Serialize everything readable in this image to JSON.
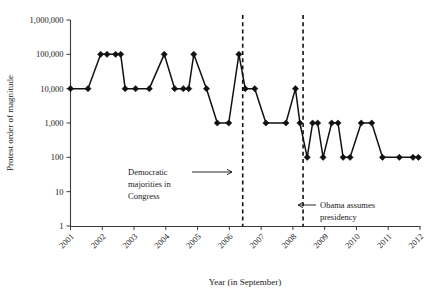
{
  "chart_data": {
    "type": "line",
    "title": "",
    "xlabel": "Year (in September)",
    "ylabel": "Protest order of magnitude",
    "yscale": "log",
    "ylim": [
      1,
      1000000
    ],
    "xlim": [
      2001,
      2012
    ],
    "grid": false,
    "legend": null,
    "ytick_labels": [
      "1,000,000",
      "100,000",
      "10,000",
      "1,000",
      "100",
      "10",
      "1"
    ],
    "ytick_values": [
      1000000,
      100000,
      10000,
      1000,
      100,
      10,
      1
    ],
    "xtick_labels": [
      "2001",
      "2002",
      "2003",
      "2004",
      "2005",
      "2006",
      "2007",
      "2008",
      "2009",
      "2010",
      "2011",
      "2012"
    ],
    "xtick_values": [
      2001,
      2002,
      2003,
      2004,
      2005,
      2006,
      2007,
      2008,
      2009,
      2010,
      2011,
      2012
    ],
    "marker": "diamond",
    "series": [
      {
        "name": "Protest order of magnitude",
        "x": [
          2001.0,
          2001.55,
          2001.95,
          2002.15,
          2002.42,
          2002.58,
          2002.72,
          2003.05,
          2003.48,
          2003.95,
          2004.28,
          2004.55,
          2004.72,
          2004.88,
          2005.28,
          2005.62,
          2005.98,
          2006.3,
          2006.5,
          2006.8,
          2007.15,
          2007.78,
          2008.08,
          2008.22,
          2008.45,
          2008.62,
          2008.78,
          2008.95,
          2009.22,
          2009.42,
          2009.58,
          2009.8,
          2010.15,
          2010.48,
          2010.82,
          2011.35,
          2011.78,
          2011.95
        ],
        "y": [
          10000,
          10000,
          100000,
          100000,
          100000,
          100000,
          10000,
          10000,
          10000,
          100000,
          10000,
          10000,
          10000,
          100000,
          10000,
          1000,
          1000,
          100000,
          10000,
          10000,
          1000,
          1000,
          10000,
          1000,
          100,
          1000,
          1000,
          100,
          1000,
          1000,
          100,
          100,
          1000,
          1000,
          100,
          100,
          100,
          100
        ]
      }
    ],
    "annotations": [
      {
        "id": "democratic-majorities",
        "lines": [
          "Democratic",
          "majorities in",
          "Congress"
        ],
        "vline_x": 2006.42,
        "arrow": "right"
      },
      {
        "id": "obama-presidency",
        "lines": [
          "Obama assumes",
          "presidency"
        ],
        "vline_x": 2008.32,
        "arrow": "left"
      }
    ]
  }
}
